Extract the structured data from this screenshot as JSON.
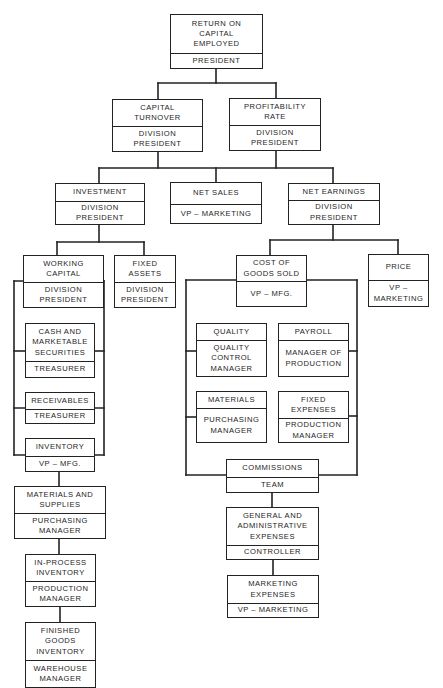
{
  "diagram": {
    "type": "tree",
    "line_color": "#222222",
    "background": "#ffffff",
    "nodes": [
      {
        "id": "roce",
        "metric": "RETURN ON\nCAPITAL\nEMPLOYED",
        "owner": "PRESIDENT",
        "box": {
          "x": 170,
          "y": 14,
          "w": 93,
          "h": 55,
          "split": 38
        }
      },
      {
        "id": "capital-turnover",
        "metric": "CAPITAL\nTURNOVER",
        "owner": "DIVISION\nPRESIDENT",
        "box": {
          "x": 112,
          "y": 99,
          "w": 91,
          "h": 53,
          "split": 26
        }
      },
      {
        "id": "profitability-rate",
        "metric": "PROFITABILITY\nRATE",
        "owner": "DIVISION\nPRESIDENT",
        "box": {
          "x": 229,
          "y": 98,
          "w": 92,
          "h": 53,
          "split": 26
        }
      },
      {
        "id": "investment",
        "metric": "INVESTMENT",
        "owner": "DIVISION\nPRESIDENT",
        "box": {
          "x": 55,
          "y": 183,
          "w": 90,
          "h": 42,
          "split": 17
        }
      },
      {
        "id": "net-sales",
        "metric": "NET SALES",
        "owner": "VP – MARKETING",
        "box": {
          "x": 170,
          "y": 182,
          "w": 92,
          "h": 42,
          "split": 21
        }
      },
      {
        "id": "net-earnings",
        "metric": "NET EARNINGS",
        "owner": "DIVISION\nPRESIDENT",
        "box": {
          "x": 288,
          "y": 183,
          "w": 92,
          "h": 42,
          "split": 16
        }
      },
      {
        "id": "working-capital",
        "metric": "WORKING\nCAPITAL",
        "owner": "DIVISION\nPRESIDENT",
        "box": {
          "x": 23,
          "y": 255,
          "w": 81,
          "h": 53,
          "split": 26
        }
      },
      {
        "id": "fixed-assets",
        "metric": "FIXED\nASSETS",
        "owner": "DIVISION\nPRESIDENT",
        "box": {
          "x": 114,
          "y": 255,
          "w": 62,
          "h": 53,
          "split": 26
        }
      },
      {
        "id": "cash",
        "metric": "CASH AND\nMARKETABLE\nSECURITIES",
        "owner": "TREASURER",
        "box": {
          "x": 25,
          "y": 323,
          "w": 70,
          "h": 55,
          "split": 37
        }
      },
      {
        "id": "receivables",
        "metric": "RECEIVABLES",
        "owner": "TREASURER",
        "box": {
          "x": 25,
          "y": 392,
          "w": 70,
          "h": 32,
          "split": 16
        }
      },
      {
        "id": "inventory",
        "metric": "INVENTORY",
        "owner": "VP – MFG.",
        "box": {
          "x": 25,
          "y": 438,
          "w": 70,
          "h": 34,
          "split": 17
        }
      },
      {
        "id": "materials-supplies",
        "metric": "MATERIALS AND\nSUPPLIES",
        "owner": "PURCHASING\nMANAGER",
        "box": {
          "x": 14,
          "y": 486,
          "w": 92,
          "h": 53,
          "split": 26
        }
      },
      {
        "id": "in-process",
        "metric": "IN-PROCESS\nINVENTORY",
        "owner": "PRODUCTION\nMANAGER",
        "box": {
          "x": 25,
          "y": 554,
          "w": 71,
          "h": 53,
          "split": 26
        }
      },
      {
        "id": "finished-goods",
        "metric": "FINISHED\nGOODS\nINVENTORY",
        "owner": "WAREHOUSE\nMANAGER",
        "box": {
          "x": 25,
          "y": 622,
          "w": 71,
          "h": 66,
          "split": 37
        }
      },
      {
        "id": "cogs",
        "metric": "COST OF\nGOODS SOLD",
        "owner": "VP – MFG.",
        "box": {
          "x": 236,
          "y": 255,
          "w": 71,
          "h": 52,
          "split": 25
        }
      },
      {
        "id": "price",
        "metric": "PRICE",
        "owner": "VP –\nMARKETING",
        "box": {
          "x": 368,
          "y": 254,
          "w": 61,
          "h": 53,
          "split": 25
        }
      },
      {
        "id": "quality",
        "metric": "QUALITY",
        "owner": "QUALITY\nCONTROL\nMANAGER",
        "box": {
          "x": 196,
          "y": 323,
          "w": 71,
          "h": 54,
          "split": 16
        }
      },
      {
        "id": "payroll",
        "metric": "PAYROLL",
        "owner": "MANAGER OF\nPRODUCTION",
        "box": {
          "x": 278,
          "y": 323,
          "w": 71,
          "h": 54,
          "split": 16
        }
      },
      {
        "id": "materials",
        "metric": "MATERIALS",
        "owner": "PURCHASING\nMANAGER",
        "box": {
          "x": 196,
          "y": 391,
          "w": 71,
          "h": 52,
          "split": 16
        }
      },
      {
        "id": "fixed-expenses",
        "metric": "FIXED\nEXPENSES",
        "owner": "PRODUCTION\nMANAGER",
        "box": {
          "x": 278,
          "y": 391,
          "w": 71,
          "h": 52,
          "split": 26
        }
      },
      {
        "id": "commissions",
        "metric": "COMMISSIONS",
        "owner": "TEAM",
        "box": {
          "x": 226,
          "y": 459,
          "w": 93,
          "h": 34,
          "split": 17
        }
      },
      {
        "id": "g-and-a",
        "metric": "GENERAL AND\nADMINISTRATIVE\nEXPENSES",
        "owner": "CONTROLLER",
        "box": {
          "x": 226,
          "y": 507,
          "w": 93,
          "h": 53,
          "split": 37
        }
      },
      {
        "id": "marketing-expenses",
        "metric": "MARKETING\nEXPENSES",
        "owner": "VP – MARKETING",
        "box": {
          "x": 227,
          "y": 575,
          "w": 92,
          "h": 43,
          "split": 27
        }
      }
    ],
    "connectors": [
      [
        216,
        69,
        216,
        83
      ],
      [
        158,
        83,
        276,
        83
      ],
      [
        158,
        83,
        158,
        99
      ],
      [
        276,
        83,
        276,
        98
      ],
      [
        158,
        152,
        158,
        168
      ],
      [
        276,
        151,
        276,
        168
      ],
      [
        99,
        168,
        333,
        168
      ],
      [
        99,
        168,
        99,
        183
      ],
      [
        216,
        168,
        216,
        182
      ],
      [
        333,
        168,
        333,
        183
      ],
      [
        99,
        225,
        99,
        242
      ],
      [
        57,
        242,
        144,
        242
      ],
      [
        57,
        242,
        57,
        255
      ],
      [
        144,
        242,
        144,
        255
      ],
      [
        333,
        225,
        333,
        240
      ],
      [
        270,
        240,
        398,
        240
      ],
      [
        270,
        240,
        270,
        255
      ],
      [
        398,
        240,
        398,
        254
      ],
      [
        14,
        281,
        104,
        281
      ],
      [
        14,
        281,
        14,
        455
      ],
      [
        104,
        281,
        104,
        455
      ],
      [
        14,
        455,
        104,
        455
      ],
      [
        14,
        351,
        25,
        351
      ],
      [
        95,
        351,
        104,
        351
      ],
      [
        14,
        408,
        104,
        408
      ],
      [
        59,
        472,
        59,
        486
      ],
      [
        59,
        539,
        59,
        554
      ],
      [
        60,
        607,
        60,
        622
      ],
      [
        186,
        280,
        357,
        280
      ],
      [
        186,
        280,
        186,
        475
      ],
      [
        357,
        280,
        357,
        475
      ],
      [
        186,
        475,
        357,
        475
      ],
      [
        186,
        351,
        196,
        351
      ],
      [
        349,
        351,
        357,
        351
      ],
      [
        186,
        417,
        196,
        417
      ],
      [
        349,
        416,
        357,
        416
      ],
      [
        272,
        493,
        272,
        507
      ],
      [
        273,
        560,
        273,
        575
      ]
    ]
  }
}
